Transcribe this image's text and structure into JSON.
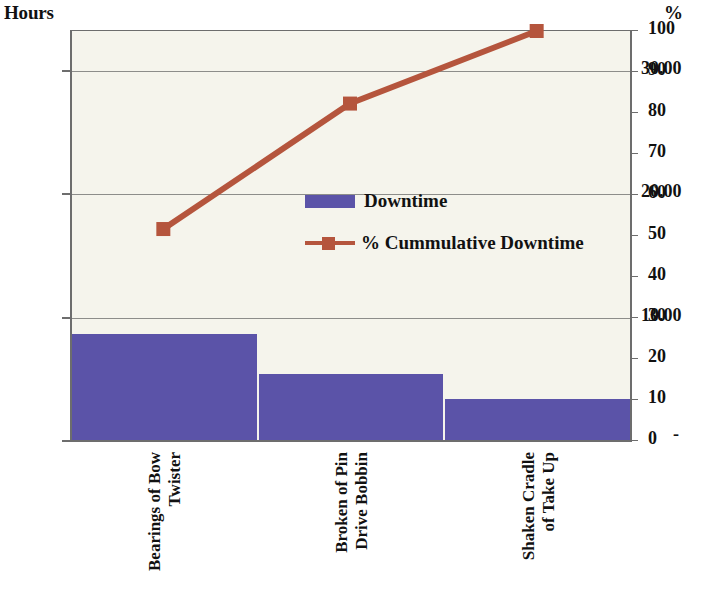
{
  "chart_data": {
    "type": "bar",
    "title": "",
    "subtitle": "",
    "categories": [
      "Bearings of Bow Twister",
      "Broken of Pin Drive Bobbin",
      "Shaken Cradle of Take Up"
    ],
    "category_lines": [
      [
        "Bearings of Bow",
        "Twister"
      ],
      [
        "Broken of Pin",
        "Drive Bobbin"
      ],
      [
        "Shaken Cradle",
        "of Take Up"
      ]
    ],
    "series": [
      {
        "name": "Downtime",
        "type": "bar",
        "axis": "left",
        "values": [
          8.7,
          5.4,
          3.4
        ],
        "color": "#5b53a8"
      },
      {
        "name": "% Cummulative Downtime",
        "type": "line",
        "axis": "right",
        "values": [
          51.7,
          82.3,
          100
        ],
        "color": "#b5553d"
      }
    ],
    "xlabel": "",
    "ylabel": "Hours",
    "y2label": "%",
    "ylim": [
      0,
      33.2
    ],
    "y2lim": [
      0,
      100
    ],
    "yticks": [
      "-",
      "10.00",
      "20.00",
      "30.00"
    ],
    "ytick_values": [
      0,
      10,
      20,
      30
    ],
    "y2ticks": [
      "0",
      "10",
      "20",
      "30",
      "40",
      "50",
      "60",
      "70",
      "80",
      "90",
      "100"
    ],
    "y2tick_values": [
      0,
      10,
      20,
      30,
      40,
      50,
      60,
      70,
      80,
      90,
      100
    ],
    "gridlines": [
      10,
      20,
      30
    ],
    "grid": true,
    "legend_position": "center",
    "legend": [
      "Downtime",
      "% Cummulative Downtime"
    ],
    "plot_background": "#f5f4ec",
    "axis_color": "#6d6d6d"
  },
  "axes": {
    "left_title": "Hours",
    "right_title": "%"
  },
  "legend": {
    "items": [
      {
        "label": "Downtime",
        "color": "#5b53a8"
      },
      {
        "label": "% Cummulative Downtime",
        "color": "#b5553d"
      }
    ]
  }
}
